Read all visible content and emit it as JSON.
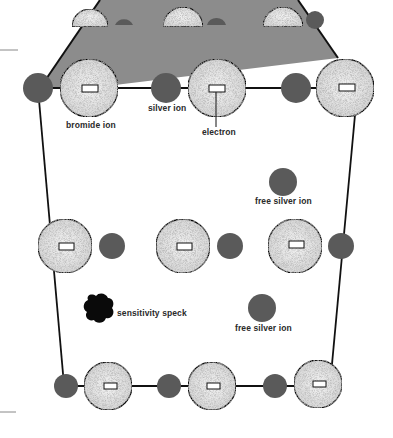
{
  "diagram": {
    "colors": {
      "plate": "#8c8c8c",
      "silver_ion": "#5a5a5a",
      "bromide_ion": "#e8e8e8",
      "speck": "#0a0a0a",
      "line": "#111111"
    },
    "labels": {
      "bromide_ion": "bromide ion",
      "silver_ion": "silver ion",
      "electron": "electron",
      "free_silver_ion_1": "free silver ion",
      "free_silver_ion_2": "free silver ion",
      "sensitivity_speck": "sensitivity speck"
    },
    "rows": [
      {
        "name": "top-face-back",
        "elements": [
          "bromide-half",
          "silver-half",
          "bromide-half",
          "silver-half",
          "bromide-half",
          "silver"
        ]
      },
      {
        "name": "top-face-front",
        "elements": [
          "silver",
          "bromide",
          "silver",
          "bromide",
          "silver",
          "bromide"
        ]
      },
      {
        "name": "middle",
        "elements": [
          "bromide",
          "silver",
          "bromide",
          "silver",
          "bromide",
          "silver"
        ]
      },
      {
        "name": "bottom",
        "elements": [
          "silver",
          "bromide",
          "silver",
          "bromide",
          "silver",
          "bromide"
        ]
      }
    ]
  }
}
